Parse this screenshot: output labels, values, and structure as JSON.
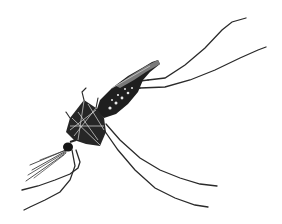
{
  "image": {
    "subject": "Mosquito illustration",
    "style": "black ink engraving on white background",
    "colors": {
      "background": "#ffffff",
      "ink": "#1a1a1a",
      "body_dark": "#202020",
      "highlight": "#d8d8d8"
    }
  }
}
